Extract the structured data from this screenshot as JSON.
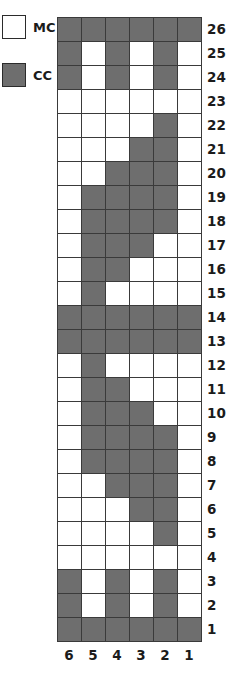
{
  "legend": {
    "items": [
      {
        "label": "MC",
        "swatch": "mc",
        "color": "#ffffff",
        "name": "main-color"
      },
      {
        "label": "CC",
        "swatch": "cc",
        "color": "#6e6e6e",
        "name": "contrast-color"
      }
    ]
  },
  "colors": {
    "main": "#ffffff",
    "contrast": "#6e6e6e",
    "grid_line": "#3a3a3a",
    "text": "#1b1b1b"
  },
  "chart_data": {
    "type": "heatmap",
    "title": "",
    "xlabel": "",
    "ylabel": "",
    "legend_position": "top-left",
    "grid": true,
    "row_labels": [
      26,
      25,
      24,
      23,
      22,
      21,
      20,
      19,
      18,
      17,
      16,
      15,
      14,
      13,
      12,
      11,
      10,
      9,
      8,
      7,
      6,
      5,
      4,
      3,
      2,
      1
    ],
    "column_labels": [
      6,
      5,
      4,
      3,
      2,
      1
    ],
    "value_map": {
      "0": "MC",
      "1": "CC"
    },
    "rows": [
      {
        "row": 26,
        "cells": [
          1,
          1,
          1,
          1,
          1,
          1
        ]
      },
      {
        "row": 25,
        "cells": [
          1,
          0,
          1,
          0,
          1,
          0
        ]
      },
      {
        "row": 24,
        "cells": [
          1,
          0,
          1,
          0,
          1,
          0
        ]
      },
      {
        "row": 23,
        "cells": [
          0,
          0,
          0,
          0,
          0,
          0
        ]
      },
      {
        "row": 22,
        "cells": [
          0,
          0,
          0,
          0,
          1,
          0
        ]
      },
      {
        "row": 21,
        "cells": [
          0,
          0,
          0,
          1,
          1,
          0
        ]
      },
      {
        "row": 20,
        "cells": [
          0,
          0,
          1,
          1,
          1,
          0
        ]
      },
      {
        "row": 19,
        "cells": [
          0,
          1,
          1,
          1,
          1,
          0
        ]
      },
      {
        "row": 18,
        "cells": [
          0,
          1,
          1,
          1,
          1,
          0
        ]
      },
      {
        "row": 17,
        "cells": [
          0,
          1,
          1,
          1,
          0,
          0
        ]
      },
      {
        "row": 16,
        "cells": [
          0,
          1,
          1,
          0,
          0,
          0
        ]
      },
      {
        "row": 15,
        "cells": [
          0,
          1,
          0,
          0,
          0,
          0
        ]
      },
      {
        "row": 14,
        "cells": [
          1,
          1,
          1,
          1,
          1,
          1
        ]
      },
      {
        "row": 13,
        "cells": [
          1,
          1,
          1,
          1,
          1,
          1
        ]
      },
      {
        "row": 12,
        "cells": [
          0,
          1,
          0,
          0,
          0,
          0
        ]
      },
      {
        "row": 11,
        "cells": [
          0,
          1,
          1,
          0,
          0,
          0
        ]
      },
      {
        "row": 10,
        "cells": [
          0,
          1,
          1,
          1,
          0,
          0
        ]
      },
      {
        "row": 9,
        "cells": [
          0,
          1,
          1,
          1,
          1,
          0
        ]
      },
      {
        "row": 8,
        "cells": [
          0,
          1,
          1,
          1,
          1,
          0
        ]
      },
      {
        "row": 7,
        "cells": [
          0,
          0,
          1,
          1,
          1,
          0
        ]
      },
      {
        "row": 6,
        "cells": [
          0,
          0,
          0,
          1,
          1,
          0
        ]
      },
      {
        "row": 5,
        "cells": [
          0,
          0,
          0,
          0,
          1,
          0
        ]
      },
      {
        "row": 4,
        "cells": [
          0,
          0,
          0,
          0,
          0,
          0
        ]
      },
      {
        "row": 3,
        "cells": [
          1,
          0,
          1,
          0,
          1,
          0
        ]
      },
      {
        "row": 2,
        "cells": [
          1,
          0,
          1,
          0,
          1,
          0
        ]
      },
      {
        "row": 1,
        "cells": [
          1,
          1,
          1,
          1,
          1,
          1
        ]
      }
    ]
  }
}
